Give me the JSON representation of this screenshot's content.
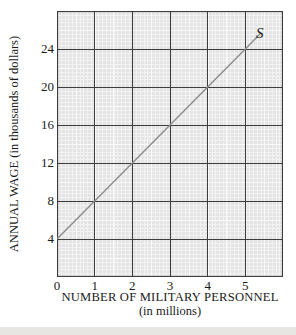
{
  "chart_data": {
    "type": "line",
    "title": "",
    "xlabel": "NUMBER OF MILITARY PERSONNEL",
    "xlabel_sub": "(in millions)",
    "ylabel": "ANNUAL WAGE (in thousands of dollars)",
    "xlim": [
      0,
      6
    ],
    "ylim": [
      0,
      28
    ],
    "x_major_step": 1,
    "y_major_step": 4,
    "x_ticks": [
      0,
      1,
      2,
      3,
      4,
      5
    ],
    "y_ticks": [
      4,
      8,
      12,
      16,
      20,
      24
    ],
    "grid": "fine graph-paper minor grid with dark major gridlines every 1 unit on x and 4 units on y",
    "series": [
      {
        "name": "S",
        "label": "S",
        "points": [
          [
            0,
            4
          ],
          [
            1,
            8
          ],
          [
            2,
            12
          ],
          [
            3,
            16
          ],
          [
            4,
            20
          ],
          [
            5,
            24
          ]
        ],
        "line_extends_to": [
          5.42,
          25.7
        ],
        "slope_thousands_per_million": 4,
        "y_intercept_thousands": 4
      }
    ],
    "colors": {
      "paper_background": "#e4e4e4",
      "paper_minor_line": "#f2f2f2",
      "major_gridline": "#3d3d3d",
      "supply_line": "#8c8c8c",
      "page_background": "#ffffff",
      "bottom_strip": "#e7e6e2",
      "text": "#1a1a1a"
    }
  }
}
